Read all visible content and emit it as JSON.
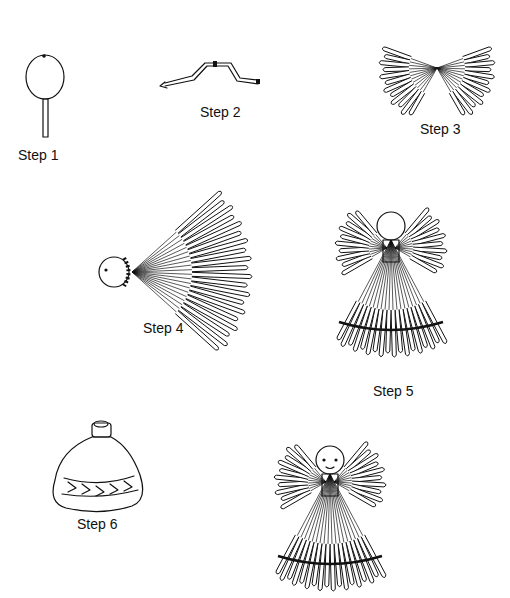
{
  "steps": [
    {
      "id": 1,
      "label": "Step 1",
      "depicts": "bead-head-on-stick",
      "label_pos": [
        18,
        147
      ]
    },
    {
      "id": 2,
      "label": "Step 2",
      "depicts": "bent-pipe-cleaner-arms",
      "label_pos": [
        200,
        104
      ]
    },
    {
      "id": 3,
      "label": "Step 3",
      "depicts": "straw-wings-tied-at-center",
      "label_pos": [
        420,
        121
      ]
    },
    {
      "id": 4,
      "label": "Step 4",
      "depicts": "head-with-straw-fan-body",
      "label_pos": [
        143,
        320
      ]
    },
    {
      "id": 5,
      "label": "Step 5",
      "depicts": "assembled-straw-angel",
      "label_pos": [
        373,
        383
      ]
    },
    {
      "id": 6,
      "label": "Step 6",
      "depicts": "bottle-with-leaf-band",
      "label_pos": [
        77,
        516
      ]
    }
  ],
  "final": {
    "depicts": "finished-angel-with-face"
  },
  "colors": {
    "ink": "#111111",
    "paper": "#ffffff"
  }
}
